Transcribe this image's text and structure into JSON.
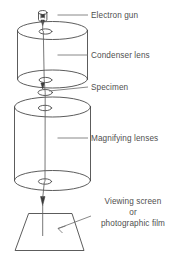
{
  "diagram": {
    "stroke_color": "#4a4a4a",
    "text_color": "#4f4f4f",
    "background_color": "#ffffff",
    "labels": {
      "electron_gun": "Electron gun",
      "condenser_lens": "Condenser lens",
      "specimen": "Specimen",
      "magnifying_lenses": "Magnifying lenses",
      "viewing_screen_line1": "Viewing screen",
      "viewing_screen_line2": "or",
      "viewing_screen_line3": "photographic film"
    },
    "parts": [
      {
        "id": "electron-gun",
        "label": "Electron gun",
        "shape": "capped-cylinder"
      },
      {
        "id": "condenser-lens",
        "label": "Condenser lens",
        "shape": "cylinder"
      },
      {
        "id": "specimen",
        "label": "Specimen",
        "shape": "ellipse"
      },
      {
        "id": "magnifying-lenses",
        "label": "Magnifying lenses",
        "shape": "cylinder"
      },
      {
        "id": "viewing-screen",
        "label": "Viewing screen or photographic film",
        "shape": "trapezoid"
      }
    ]
  }
}
